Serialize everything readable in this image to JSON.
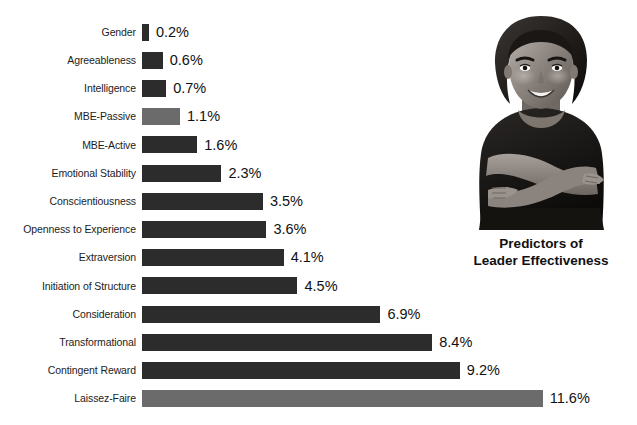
{
  "chart_data": {
    "type": "bar",
    "orientation": "horizontal",
    "title": "Predictors of Leader Effectiveness",
    "title_lines": [
      "Predictors of",
      "Leader Effectiveness"
    ],
    "xlabel": "",
    "ylabel": "",
    "grid": false,
    "legend": "none",
    "xlim": [
      0,
      11.6
    ],
    "unit": "%",
    "categories": [
      "Gender",
      "Agreeableness",
      "Intelligence",
      "MBE-Passive",
      "MBE-Active",
      "Emotional Stability",
      "Conscientiousness",
      "Openness to Experience",
      "Extraversion",
      "Initiation of Structure",
      "Consideration",
      "Transformational",
      "Contingent Reward",
      "Laissez-Faire"
    ],
    "values": [
      0.2,
      0.6,
      0.7,
      1.1,
      1.6,
      2.3,
      3.5,
      3.6,
      4.1,
      4.5,
      6.9,
      8.4,
      9.2,
      11.6
    ],
    "value_labels": [
      "0.2%",
      "0.6%",
      "0.7%",
      "1.1%",
      "1.6%",
      "2.3%",
      "3.5%",
      "3.6%",
      "4.1%",
      "4.5%",
      "6.9%",
      "8.4%",
      "9.2%",
      "11.6%"
    ],
    "bar_shades": [
      "dark",
      "dark",
      "dark",
      "light",
      "dark",
      "dark",
      "dark",
      "dark",
      "dark",
      "dark",
      "dark",
      "dark",
      "dark",
      "light"
    ],
    "colors": {
      "bar_dark": "#2c2c2c",
      "bar_light": "#6b6b6b",
      "text": "#111111",
      "background": "#ffffff"
    }
  },
  "photo": {
    "name": "smiling-businesswoman-arms-crossed",
    "description": "Grayscale photograph of a smiling woman with arms crossed"
  }
}
